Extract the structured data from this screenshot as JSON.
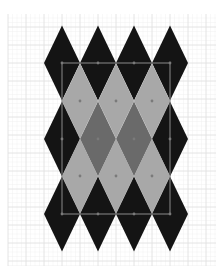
{
  "canvas": {
    "width": 224,
    "height": 278,
    "background": "#ffffff"
  },
  "grid": {
    "x0": 8,
    "y0": 14,
    "x1": 216,
    "y1": 266,
    "origin_x": 62,
    "origin_y": 63,
    "minor_step": 4.5,
    "major_step": 18,
    "minor_color": "#f1f1f1",
    "major_color": "#e2e2e2"
  },
  "pattern": {
    "name": "argyle diamond pattern",
    "half_width": 18,
    "half_height": 37.5,
    "colors": {
      "black": "#141414",
      "light": "#a8a8a8",
      "dark": "#6a6a6a"
    },
    "diamonds": [
      {
        "cx": 62,
        "cy": 63,
        "fill": "black"
      },
      {
        "cx": 98,
        "cy": 63,
        "fill": "black"
      },
      {
        "cx": 134,
        "cy": 63,
        "fill": "black"
      },
      {
        "cx": 170,
        "cy": 63,
        "fill": "black"
      },
      {
        "cx": 80,
        "cy": 101,
        "fill": "light"
      },
      {
        "cx": 116,
        "cy": 101,
        "fill": "light"
      },
      {
        "cx": 152,
        "cy": 101,
        "fill": "light"
      },
      {
        "cx": 62,
        "cy": 139,
        "fill": "black"
      },
      {
        "cx": 98,
        "cy": 139,
        "fill": "dark"
      },
      {
        "cx": 134,
        "cy": 139,
        "fill": "dark"
      },
      {
        "cx": 170,
        "cy": 139,
        "fill": "black"
      },
      {
        "cx": 80,
        "cy": 176,
        "fill": "light"
      },
      {
        "cx": 116,
        "cy": 176,
        "fill": "light"
      },
      {
        "cx": 152,
        "cy": 176,
        "fill": "light"
      },
      {
        "cx": 62,
        "cy": 214,
        "fill": "black"
      },
      {
        "cx": 98,
        "cy": 214,
        "fill": "black"
      },
      {
        "cx": 134,
        "cy": 214,
        "fill": "black"
      },
      {
        "cx": 170,
        "cy": 214,
        "fill": "black"
      }
    ]
  },
  "selection": {
    "x": 62,
    "y": 63,
    "width": 108,
    "height": 151,
    "stroke": "#8a8a8a",
    "handle_color": "#7a7a7a"
  }
}
